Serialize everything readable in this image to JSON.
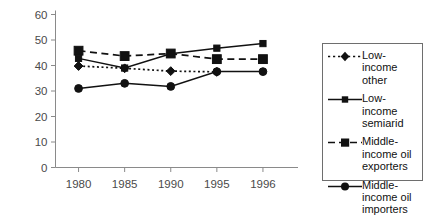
{
  "chart_data": {
    "type": "line",
    "title": "",
    "subtitle": "",
    "xlabel": "",
    "ylabel": "",
    "categories": [
      "1980",
      "1985",
      "1990",
      "1995",
      "1996"
    ],
    "yticks": [
      "0",
      "10",
      "20",
      "30",
      "40",
      "50",
      "60"
    ],
    "ylim": [
      0,
      60
    ],
    "grid": false,
    "legend_position": "right",
    "series": [
      {
        "name": "Low-income other",
        "label": "Low-\nincome\nother",
        "marker": "diamond",
        "linestyle": "dotted",
        "color": "#111111",
        "x": [
          "1980",
          "1985",
          "1990",
          "1995"
        ],
        "values": [
          39.8,
          38.9,
          37.8,
          37.5
        ]
      },
      {
        "name": "Low-income semiarid",
        "label": "Low-\nincome\nsemiarid",
        "marker": "square",
        "linestyle": "solid",
        "color": "#111111",
        "x": [
          "1980",
          "1985",
          "1990",
          "1995",
          "1996"
        ],
        "values": [
          42.8,
          39.0,
          44.6,
          46.8,
          48.6
        ]
      },
      {
        "name": "Middle-income oil exporters",
        "label": "Middle-\nincome oil\nexporters",
        "marker": "square",
        "linestyle": "dashed",
        "color": "#111111",
        "x": [
          "1980",
          "1985",
          "1990",
          "1995",
          "1996"
        ],
        "values": [
          45.8,
          43.7,
          44.7,
          42.5,
          42.5
        ]
      },
      {
        "name": "Middle-income oil importers",
        "label": "Middle-\nincome oil\nimporters",
        "marker": "circle",
        "linestyle": "solid",
        "color": "#111111",
        "x": [
          "1980",
          "1985",
          "1990",
          "1995",
          "1996"
        ],
        "values": [
          31.0,
          33.0,
          31.8,
          37.6,
          37.6
        ]
      }
    ]
  },
  "legend": {
    "entries": [
      {
        "label": "Low-\nincome\nother"
      },
      {
        "label": "Low-\nincome\nsemiarid"
      },
      {
        "label": "Middle-\nincome oil\nexporters"
      },
      {
        "label": "Middle-\nincome oil\nimporters"
      }
    ]
  }
}
